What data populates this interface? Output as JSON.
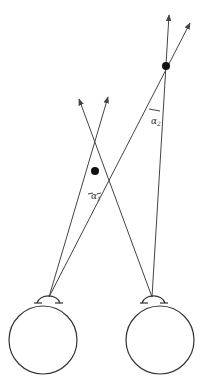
{
  "diagram": {
    "labels": {
      "alpha1": "α",
      "alpha1_sub": "1",
      "alpha2": "α",
      "alpha2_sub": "2"
    },
    "colors": {
      "line": "#444444",
      "point": "#111111",
      "background": "#ffffff"
    },
    "elements": {
      "left_eye": {
        "cx": 43,
        "cy": 340,
        "r": 34
      },
      "right_eye": {
        "cx": 160,
        "cy": 340,
        "r": 34
      },
      "near_point": {
        "x": 95,
        "y": 170
      },
      "far_point": {
        "x": 166,
        "y": 66
      }
    }
  }
}
